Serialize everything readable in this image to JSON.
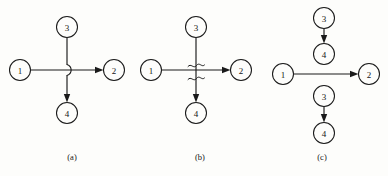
{
  "figure": {
    "background_color": "#fdfdfb",
    "ink_color": "#1a1a1a",
    "width": 388,
    "height": 176
  },
  "panels": [
    {
      "id": "a",
      "caption": "(a)",
      "caption_x": 72,
      "caption_y": 157,
      "crossing_style": "line-hop",
      "nodes": [
        {
          "id": "a1",
          "label": "1",
          "cx": 20,
          "cy": 70,
          "r": 10.5
        },
        {
          "id": "a2",
          "label": "2",
          "cx": 114,
          "cy": 70,
          "r": 10.5
        },
        {
          "id": "a3",
          "label": "3",
          "cx": 67,
          "cy": 27,
          "r": 10.5
        },
        {
          "id": "a4",
          "label": "4",
          "cx": 67,
          "cy": 113,
          "r": 10.5
        }
      ],
      "edges": [
        {
          "id": "a-1-2",
          "from": "1",
          "to": "2",
          "direction": "right"
        },
        {
          "id": "a-3-4",
          "from": "3",
          "to": "4",
          "direction": "down"
        }
      ]
    },
    {
      "id": "b",
      "caption": "(b)",
      "caption_x": 200,
      "caption_y": 157,
      "crossing_style": "wave-break",
      "nodes": [
        {
          "id": "b1",
          "label": "1",
          "cx": 151,
          "cy": 70,
          "r": 10.5
        },
        {
          "id": "b2",
          "label": "2",
          "cx": 241,
          "cy": 70,
          "r": 10.5
        },
        {
          "id": "b3",
          "label": "3",
          "cx": 196,
          "cy": 27,
          "r": 10.5
        },
        {
          "id": "b4",
          "label": "4",
          "cx": 196,
          "cy": 113,
          "r": 10.5
        }
      ],
      "edges": [
        {
          "id": "b-1-2",
          "from": "1",
          "to": "2",
          "direction": "right"
        },
        {
          "id": "b-3-4",
          "from": "3",
          "to": "4",
          "direction": "down"
        }
      ]
    },
    {
      "id": "c",
      "caption": "(c)",
      "caption_x": 322,
      "caption_y": 157,
      "crossing_style": "none",
      "nodes": [
        {
          "id": "c3t",
          "label": "3",
          "cx": 324,
          "cy": 18,
          "r": 10.5
        },
        {
          "id": "c4t",
          "label": "4",
          "cx": 324,
          "cy": 54,
          "r": 10.5
        },
        {
          "id": "c1",
          "label": "1",
          "cx": 283,
          "cy": 74,
          "r": 10.5
        },
        {
          "id": "c2",
          "label": "2",
          "cx": 369,
          "cy": 74,
          "r": 10.5
        },
        {
          "id": "c3b",
          "label": "3",
          "cx": 324,
          "cy": 96,
          "r": 10.5
        },
        {
          "id": "c4b",
          "label": "4",
          "cx": 324,
          "cy": 133,
          "r": 10.5
        }
      ],
      "edges": [
        {
          "id": "c-3t-4t",
          "from": "3",
          "to": "4",
          "direction": "down"
        },
        {
          "id": "c-1-2",
          "from": "1",
          "to": "2",
          "direction": "right"
        },
        {
          "id": "c-3b-4b",
          "from": "3",
          "to": "4",
          "direction": "down"
        }
      ]
    }
  ]
}
